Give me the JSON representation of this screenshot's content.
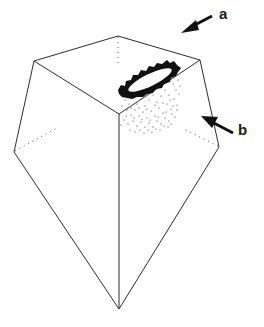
{
  "figure": {
    "labels": {
      "a": "a",
      "b": "b"
    },
    "colors": {
      "line": "#2b2b2b",
      "ink": "#111111",
      "background": "#ffffff"
    },
    "vertices": {
      "top_back": [
        118,
        36
      ],
      "top_left": [
        34,
        61
      ],
      "top_right": [
        200,
        60
      ],
      "center_front": [
        119,
        114
      ],
      "left": [
        14,
        152
      ],
      "right": [
        219,
        147
      ],
      "bottom_apex": [
        119,
        309
      ]
    }
  }
}
